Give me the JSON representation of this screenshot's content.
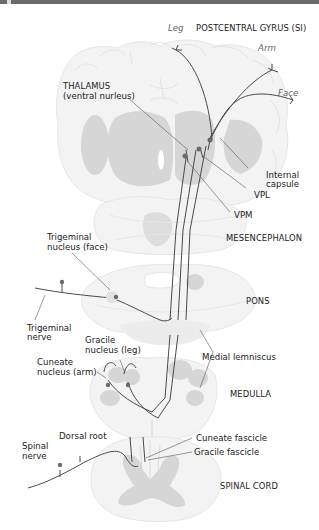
{
  "figure": {
    "colors": {
      "top_bar": "#6b6b6b",
      "tissue": "#f3f3f3",
      "gray_matter": "#d6d6d6",
      "pathway": "#4a4a4a",
      "soma": "#6a6a6a",
      "label": "#1a1a1a",
      "body_region_label": "#666666"
    }
  },
  "labels": {
    "leg": "Leg",
    "arm": "Arm",
    "face": "Face",
    "postcentral_gyrus": "POSTCENTRAL GYRUS (SI)",
    "thalamus_1": "THALAMUS",
    "thalamus_2": "(ventral nurleus)",
    "internal_capsule_1": "Internal",
    "internal_capsule_2": "capsule",
    "vpl": "VPL",
    "vpm": "VPM",
    "mesencephalon": "MESENCEPHALON",
    "trigeminal_nucleus_1": "Trigeminal",
    "trigeminal_nucleus_2": "nucleus (face)",
    "pons": "PONS",
    "trigeminal_nerve_1": "Trigeminal",
    "trigeminal_nerve_2": "nerve",
    "gracile_nucleus_1": "Gracile",
    "gracile_nucleus_2": "nucleus (leg)",
    "cuneate_nucleus_1": "Cuneate",
    "cuneate_nucleus_2": "nucleus (arm)",
    "medial_lemniscus": "Medial lemniscus",
    "medulla": "MEDULLA",
    "dorsal_root": "Dorsal root",
    "spinal_nerve_1": "Spinal",
    "spinal_nerve_2": "nerve",
    "cuneate_fascicle": "Cuneate fascicle",
    "gracile_fascicle": "Gracile fascicle",
    "spinal_cord": "SPINAL CORD"
  }
}
